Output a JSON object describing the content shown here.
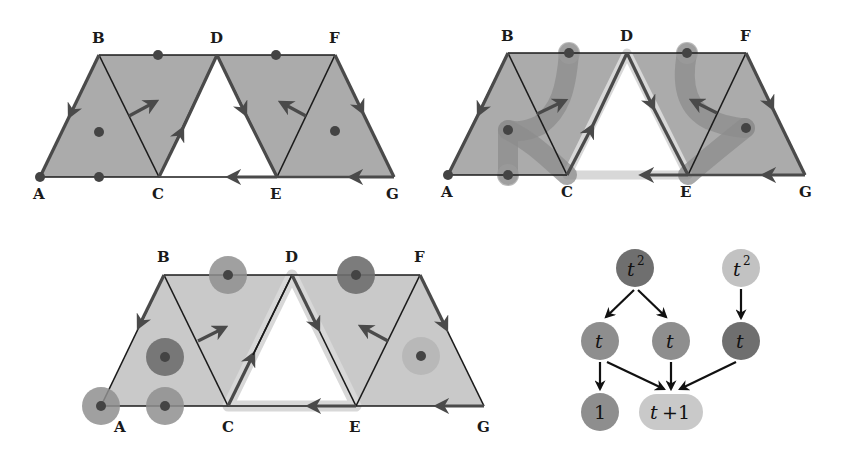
{
  "colors": {
    "fill_dark": "#ababab",
    "fill_light": "#c9c9c9",
    "edge": "#1a1a1a",
    "arrow": "#4a4a4a",
    "dot": "#444444",
    "halo_white": "#dcdcdc",
    "path_band": "#8c8c8c",
    "node_dark": "#6f6f6f",
    "node_mid": "#8e8e8e",
    "node_light": "#c2c2c2"
  },
  "panels": {
    "top_left": {
      "vertices": {
        "A": "A",
        "B": "B",
        "C": "C",
        "D": "D",
        "E": "E",
        "F": "F",
        "G": "G"
      }
    },
    "top_right": {
      "vertices": {
        "A": "A",
        "B": "B",
        "C": "C",
        "D": "D",
        "E": "E",
        "F": "F",
        "G": "G"
      }
    },
    "bottom": {
      "vertices": {
        "A": "A",
        "B": "B",
        "C": "C",
        "D": "D",
        "E": "E",
        "F": "F",
        "G": "G"
      }
    }
  },
  "tree": {
    "nodes": {
      "root_left": {
        "base": "t",
        "exp": "2"
      },
      "mid_left": {
        "label": "t"
      },
      "mid_center": {
        "label": "t"
      },
      "root_right": {
        "base": "t",
        "exp": "2"
      },
      "mid_right": {
        "label": "t"
      },
      "leaf_one": {
        "label": "1"
      },
      "leaf_sum": {
        "label_t": "t",
        "label_rest": "+1"
      }
    }
  }
}
